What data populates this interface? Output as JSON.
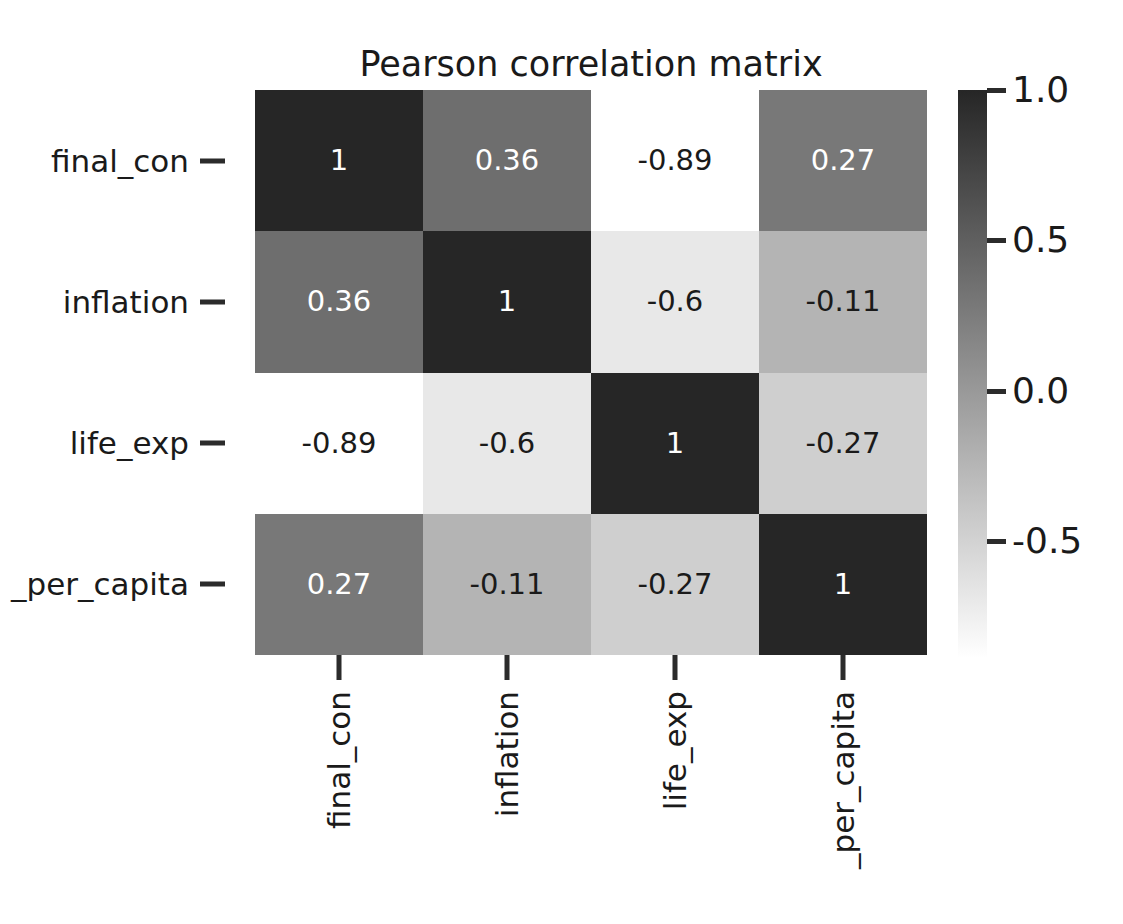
{
  "chart_data": {
    "type": "heatmap",
    "title": "Pearson correlation matrix",
    "xlabel": "",
    "ylabel": "",
    "grid": false,
    "legend_position": "right",
    "colormap": "grayscale-reversed",
    "colorbar": {
      "ticks": [
        "1.0",
        "0.5",
        "0.0",
        "-0.5"
      ],
      "tick_values": [
        1.0,
        0.5,
        0.0,
        -0.5
      ],
      "vmin": -0.89,
      "vmax": 1.0,
      "top_color": "#262626",
      "bottom_color": "#ffffff"
    },
    "categories": [
      "final_con",
      "inflation",
      "life_exp",
      "_per_capita"
    ],
    "row_labels": [
      "final_con",
      "inflation",
      "life_exp",
      "_per_capita"
    ],
    "col_labels": [
      "final_con",
      "inflation",
      "life_exp",
      "_per_capita"
    ],
    "matrix": [
      [
        1,
        0.36,
        -0.89,
        0.27
      ],
      [
        0.36,
        1,
        -0.6,
        -0.11
      ],
      [
        -0.89,
        -0.6,
        1,
        -0.27
      ],
      [
        0.27,
        -0.11,
        -0.27,
        1
      ]
    ],
    "cells": [
      [
        {
          "text": "1",
          "fill": "#262626",
          "color": "#ffffff"
        },
        {
          "text": "0.36",
          "fill": "#6e6e6e",
          "color": "#ffffff"
        },
        {
          "text": "-0.89",
          "fill": "#ffffff",
          "color": "#1a1a1a"
        },
        {
          "text": "0.27",
          "fill": "#787878",
          "color": "#ffffff"
        }
      ],
      [
        {
          "text": "0.36",
          "fill": "#6e6e6e",
          "color": "#ffffff"
        },
        {
          "text": "1",
          "fill": "#262626",
          "color": "#ffffff"
        },
        {
          "text": "-0.6",
          "fill": "#e8e8e8",
          "color": "#1a1a1a"
        },
        {
          "text": "-0.11",
          "fill": "#b4b4b4",
          "color": "#1a1a1a"
        }
      ],
      [
        {
          "text": "-0.89",
          "fill": "#ffffff",
          "color": "#1a1a1a"
        },
        {
          "text": "-0.6",
          "fill": "#e8e8e8",
          "color": "#1a1a1a"
        },
        {
          "text": "1",
          "fill": "#262626",
          "color": "#ffffff"
        },
        {
          "text": "-0.27",
          "fill": "#cfcfcf",
          "color": "#1a1a1a"
        }
      ],
      [
        {
          "text": "0.27",
          "fill": "#787878",
          "color": "#ffffff"
        },
        {
          "text": "-0.11",
          "fill": "#b4b4b4",
          "color": "#1a1a1a"
        },
        {
          "text": "-0.27",
          "fill": "#cfcfcf",
          "color": "#1a1a1a"
        },
        {
          "text": "1",
          "fill": "#262626",
          "color": "#ffffff"
        }
      ]
    ]
  }
}
